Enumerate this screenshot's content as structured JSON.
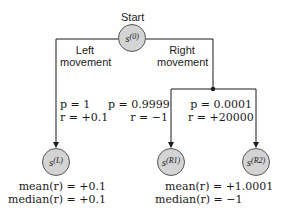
{
  "start_label": "Start",
  "nodes": {
    "s0": {
      "base": "s",
      "sup": "(0)"
    },
    "sL": {
      "base": "s",
      "sup": "(L)"
    },
    "sR1": {
      "base": "s",
      "sup": "(R1)"
    },
    "sR2": {
      "base": "s",
      "sup": "(R2)"
    }
  },
  "branches": {
    "left": {
      "line1": "Left",
      "line2": "movement"
    },
    "right": {
      "line1": "Right",
      "line2": "movement"
    }
  },
  "edges": {
    "L": {
      "p": "p = 1",
      "r": "r = +0.1"
    },
    "R1": {
      "p": "p = 0.9999",
      "r": "r = −1"
    },
    "R2": {
      "p": "p = 0.0001",
      "r": "r = +20000"
    }
  },
  "stats": {
    "left": {
      "mean": "mean(r) = +0.1",
      "median": "median(r) = +0.1"
    },
    "right": {
      "mean": "mean(r) = +1.0001",
      "median": "median(r) = −1"
    }
  },
  "colors": {
    "node_fill": "#d4d4d4",
    "line": "#1a1a1a"
  }
}
